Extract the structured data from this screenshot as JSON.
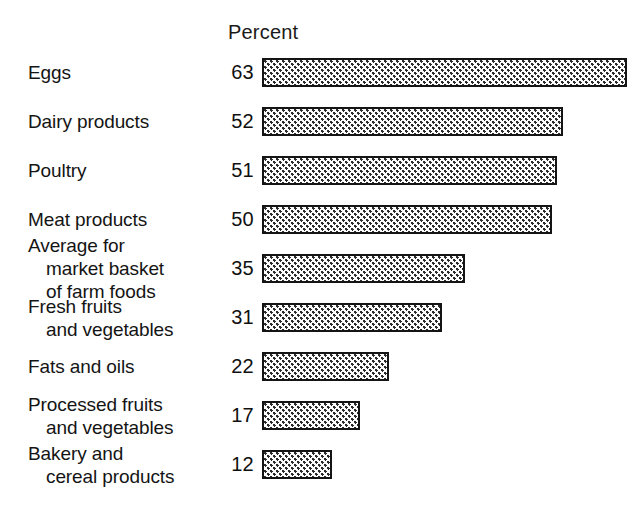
{
  "header": {
    "column_title": "Percent"
  },
  "chart_data": {
    "type": "bar",
    "orientation": "horizontal",
    "title": "",
    "subtitle": "",
    "xlabel": "Percent",
    "ylabel": "",
    "xlim": [
      0,
      63
    ],
    "grid": false,
    "legend": null,
    "value_labels_shown": true,
    "categories": [
      "Eggs",
      "Dairy products",
      "Poultry",
      "Meat products",
      "Average for market basket of farm foods",
      "Fresh fruits and vegetables",
      "Fats and oils",
      "Processed fruits and vegetables",
      "Bakery and cereal products"
    ],
    "values": [
      63,
      52,
      51,
      50,
      35,
      31,
      22,
      17,
      12
    ],
    "rows": [
      {
        "label_lines": [
          "Eggs"
        ],
        "value": "63",
        "value_number": 63
      },
      {
        "label_lines": [
          "Dairy products"
        ],
        "value": "52",
        "value_number": 52
      },
      {
        "label_lines": [
          "Poultry"
        ],
        "value": "51",
        "value_number": 51
      },
      {
        "label_lines": [
          "Meat products"
        ],
        "value": "50",
        "value_number": 50
      },
      {
        "label_lines": [
          "Average for",
          "market basket",
          "of farm foods"
        ],
        "value": "35",
        "value_number": 35
      },
      {
        "label_lines": [
          "Fresh fruits",
          "and vegetables"
        ],
        "value": "31",
        "value_number": 31
      },
      {
        "label_lines": [
          "Fats and oils"
        ],
        "value": "22",
        "value_number": 22
      },
      {
        "label_lines": [
          "Processed fruits",
          "and vegetables"
        ],
        "value": "17",
        "value_number": 17
      },
      {
        "label_lines": [
          "Bakery and",
          "cereal products"
        ],
        "value": "12",
        "value_number": 12
      }
    ]
  },
  "style": {
    "bar_fill": "#ffffff",
    "bar_pattern": "#2b2b2b",
    "bar_outline": "#141414",
    "text_color": "#111111",
    "background": "#ffffff"
  }
}
